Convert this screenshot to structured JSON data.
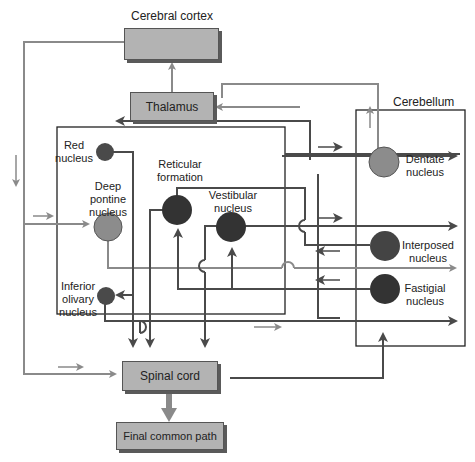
{
  "labels": {
    "cerebral_cortex": "Cerebral cortex",
    "thalamus": "Thalamus",
    "cerebellum": "Cerebellum",
    "red_nucleus_1": "Red",
    "red_nucleus_2": "nucleus",
    "deep_pontine_1": "Deep",
    "deep_pontine_2": "pontine",
    "deep_pontine_3": "nucleus",
    "reticular_1": "Reticular",
    "reticular_2": "formation",
    "vestibular_1": "Vestibular",
    "vestibular_2": "nucleus",
    "inferior_olivary_1": "Inferior",
    "inferior_olivary_2": "olivary",
    "inferior_olivary_3": "nucleus",
    "dentate_1": "Dentate",
    "dentate_2": "nucleus",
    "interposed_1": "Interposed",
    "interposed_2": "nucleus",
    "fastigial_1": "Fastigial",
    "fastigial_2": "nucleus",
    "spinal_cord": "Spinal cord",
    "final_common_path": "Final common path"
  },
  "colors": {
    "box_fill": "#b3b3b3",
    "box_shadow": "#5a5a5a",
    "gray_path": "#8a8a8a",
    "dark_path": "#4a4a4a",
    "dark_nucleus": "#3a3a3a",
    "mid_nucleus": "#5a5a5a",
    "light_nucleus": "#8c8c8c"
  }
}
